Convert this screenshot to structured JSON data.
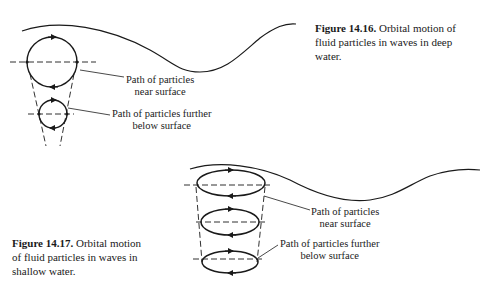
{
  "figures": [
    {
      "id": "14.16",
      "caption_number": "Figure 14.16.",
      "caption_text": "Orbital motion of fluid particles in waves in deep water.",
      "caption_lines": [
        "Orbital motion of",
        "fluid particles in waves in deep",
        "water."
      ],
      "labels": {
        "near_surface": [
          "Path of particles",
          "near surface"
        ],
        "below_surface": [
          "Path of particles further",
          "below surface"
        ]
      }
    },
    {
      "id": "14.17",
      "caption_number": "Figure 14.17.",
      "caption_text": "Orbital motion of fluid particles in waves in shallow water.",
      "caption_lines": [
        "Orbital motion",
        "of fluid particles in waves in",
        "shallow water."
      ],
      "labels": {
        "near_surface": [
          "Path of particles",
          "near surface"
        ],
        "below_surface": [
          "Path of particles further",
          "below surface"
        ]
      }
    }
  ]
}
